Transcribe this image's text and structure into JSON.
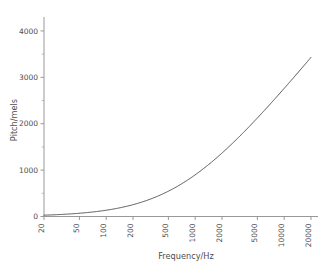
{
  "chart_data": {
    "type": "line",
    "title": "",
    "xlabel": "Frequency/Hz",
    "ylabel": "Pitch/mels",
    "xscale": "log",
    "yscale": "linear",
    "xlim": [
      20,
      24000
    ],
    "ylim": [
      0,
      4300
    ],
    "grid": false,
    "legend": null,
    "xticks": [
      20,
      50,
      100,
      200,
      500,
      1000,
      2000,
      5000,
      10000,
      20000
    ],
    "xticklabels": [
      "20",
      "50",
      "100",
      "200",
      "500",
      "1000",
      "2000",
      "5000",
      "10000",
      "20000"
    ],
    "yticks": [
      0,
      1000,
      2000,
      3000,
      4000
    ],
    "yticklabels": [
      "0",
      "1000",
      "2000",
      "3000",
      "4000"
    ],
    "yminorticks": [
      500,
      1500,
      2500,
      3500
    ],
    "series": [
      {
        "name": "mel scale",
        "formula": "m = 2595 * log10(1 + f/700)",
        "x": [
          20,
          25,
          30,
          40,
          50,
          60,
          80,
          100,
          125,
          150,
          200,
          250,
          300,
          400,
          500,
          600,
          700,
          800,
          1000,
          1250,
          1500,
          2000,
          2500,
          3000,
          4000,
          5000,
          6000,
          7000,
          8000,
          10000,
          12000,
          15000,
          20000
        ],
        "y": [
          31,
          39,
          47,
          62,
          77,
          91,
          120,
          150,
          185,
          219,
          283,
          344,
          401,
          509,
          607,
          698,
          781,
          859,
          999,
          1150,
          1280,
          1497,
          1672,
          1820,
          2060,
          2249,
          2405,
          2537,
          2652,
          2843,
          2997,
          3180,
          3429
        ]
      }
    ]
  },
  "axes": {
    "x_label": "Frequency/Hz",
    "y_label": "Pitch/mels"
  },
  "colors": {
    "curve": "#555555",
    "axis": "#8c8c8c",
    "text": "#4d4d4d",
    "background": "#ffffff"
  }
}
